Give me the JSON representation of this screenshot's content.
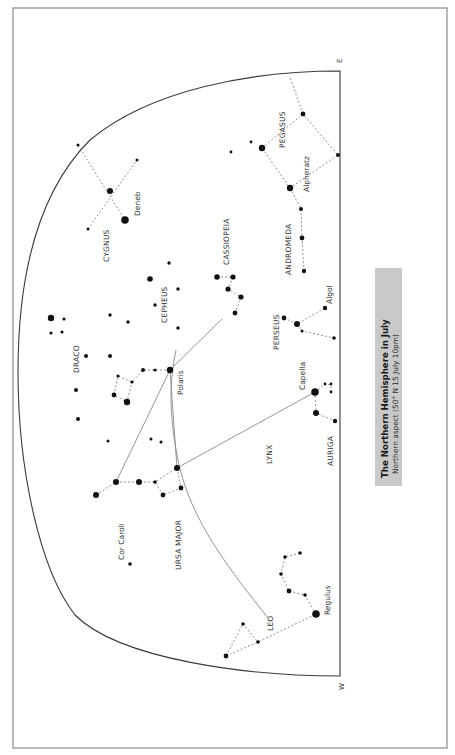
{
  "title_box": {
    "title": "The Northern Hemisphere in July",
    "subtitle": "Northern aspect (50° N 15 July 10pm)"
  },
  "cardinals": {
    "east": "E",
    "west": "W"
  },
  "constellations": {
    "pegasus": "PEGASUS",
    "andromeda": "ANDROMEDA",
    "cassiopeia": "CASSIOPEIA",
    "cygnus": "CYGNUS",
    "cepheus": "CEPHEUS",
    "draco": "DRACO",
    "perseus": "PERSEUS",
    "auriga": "AURIGA",
    "lynx": "LYNX",
    "ursa_major": "URSA MAJOR",
    "leo": "LEO"
  },
  "stars": {
    "alpheratz": "Alpheratz",
    "deneb": "Deneb",
    "polaris": "Polaris",
    "algol": "Algol",
    "capella": "Capella",
    "cor_caroli": "Cor Caroli",
    "regulus": "Regulus"
  },
  "colors": {
    "frame": "#8a8a8a",
    "horizon": "#3a3a3a",
    "star": "#111111",
    "title_box": "#c9c9c9"
  }
}
